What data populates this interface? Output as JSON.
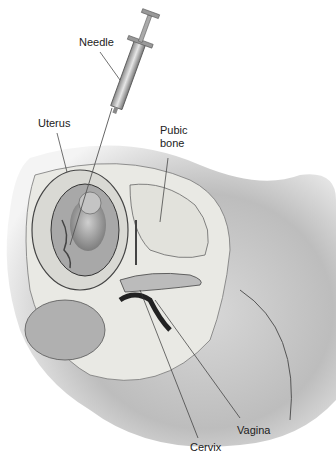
{
  "figure": {
    "labels": {
      "needle": "Needle",
      "uterus": "Uterus",
      "pubic_bone_line1": "Pubic",
      "pubic_bone_line2": "bone",
      "cervix": "Cervix",
      "vagina": "Vagina"
    }
  }
}
